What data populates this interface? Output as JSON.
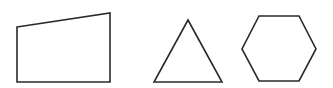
{
  "diagram": {
    "background": "#ffffff",
    "stroke_color": "#2a2a2a",
    "shapes": [
      {
        "type": "quadrilateral",
        "points": "17,27 110,13 110,82 17,82"
      },
      {
        "type": "triangle",
        "points": "188,20 222,82 154,82"
      },
      {
        "type": "hexagon",
        "points": "259,16 299,16 316,49 299,81 259,81 242,49"
      }
    ]
  }
}
